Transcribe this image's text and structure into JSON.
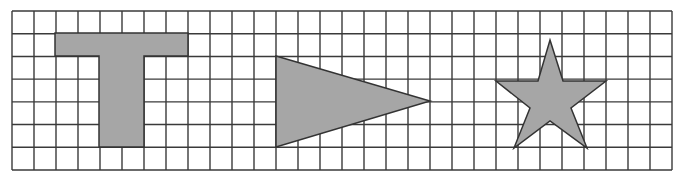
{
  "figure": {
    "grid": {
      "left": 12,
      "top": 11,
      "right": 672,
      "bottom": 170,
      "columns": 30,
      "rows": 7,
      "line_color": "#3a3a3a",
      "line_width": 1.4
    },
    "colors": {
      "shape_fill": "#a6a6a6",
      "shape_stroke": "#333333",
      "background": "#ffffff"
    },
    "shapes": [
      {
        "name": "t-shape",
        "points": [
          [
            55,
            33
          ],
          [
            188,
            33
          ],
          [
            188,
            56
          ],
          [
            144,
            56
          ],
          [
            144,
            147
          ],
          [
            99,
            147
          ],
          [
            99,
            56
          ],
          [
            55,
            56
          ]
        ]
      },
      {
        "name": "triangle",
        "points": [
          [
            276,
            56
          ],
          [
            430,
            101
          ],
          [
            276,
            147
          ]
        ]
      },
      {
        "name": "star",
        "points": [
          [
            550,
            40
          ],
          [
            563,
            81
          ],
          [
            606,
            81
          ],
          [
            571,
            108
          ],
          [
            587,
            148
          ],
          [
            550,
            121
          ],
          [
            514,
            148
          ],
          [
            530,
            108
          ],
          [
            496,
            81
          ],
          [
            538,
            81
          ]
        ]
      }
    ]
  }
}
